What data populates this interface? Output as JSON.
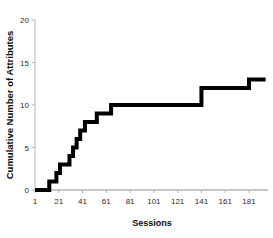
{
  "chart_data": {
    "type": "line",
    "subtype": "step-post",
    "title": "",
    "xlabel": "Sessions",
    "ylabel": "Cumulative Number of Attributes",
    "xlim": [
      1,
      197
    ],
    "ylim": [
      0,
      20
    ],
    "xticks": [
      1,
      21,
      41,
      61,
      81,
      101,
      121,
      141,
      161,
      181
    ],
    "xtick_labels": [
      "1",
      "21",
      "41",
      "61",
      "81",
      "101",
      "121",
      "141",
      "161",
      "181"
    ],
    "yticks": [
      0,
      5,
      10,
      15,
      20
    ],
    "ytick_labels": [
      "0",
      "5",
      "10",
      "15",
      "20"
    ],
    "grid": false,
    "legend": null,
    "series": [
      {
        "name": "Cumulative attributes",
        "color": "#000000",
        "line_width": 4,
        "x": [
          1,
          13,
          16,
          19,
          22,
          25,
          28,
          33,
          36,
          39,
          43,
          48,
          53,
          57,
          65,
          141,
          146,
          181,
          195
        ],
        "y": [
          0,
          0,
          1,
          1,
          2,
          3,
          3,
          4,
          5,
          6,
          7,
          8,
          8,
          9,
          10,
          10,
          12,
          12,
          13
        ],
        "steps": [
          {
            "x_start": 1,
            "x_end": 13,
            "value": 0
          },
          {
            "x_start": 13,
            "x_end": 19,
            "value": 1
          },
          {
            "x_start": 19,
            "x_end": 22,
            "value": 2
          },
          {
            "x_start": 22,
            "x_end": 30,
            "value": 3
          },
          {
            "x_start": 30,
            "x_end": 33,
            "value": 4
          },
          {
            "x_start": 33,
            "x_end": 36,
            "value": 5
          },
          {
            "x_start": 36,
            "x_end": 39,
            "value": 6
          },
          {
            "x_start": 39,
            "x_end": 43,
            "value": 7
          },
          {
            "x_start": 43,
            "x_end": 53,
            "value": 8
          },
          {
            "x_start": 53,
            "x_end": 65,
            "value": 9
          },
          {
            "x_start": 65,
            "x_end": 141,
            "value": 10
          },
          {
            "x_start": 141,
            "x_end": 181,
            "value": 12
          },
          {
            "x_start": 181,
            "x_end": 195,
            "value": 13
          }
        ]
      }
    ]
  },
  "axes": {
    "y_axis_color": "#b3b3b3",
    "x_axis_color": "#b3b3b3",
    "tick_color": "#b3b3b3",
    "label_color": "#2b2b2b"
  },
  "figure": {
    "background": "#ffffff"
  }
}
